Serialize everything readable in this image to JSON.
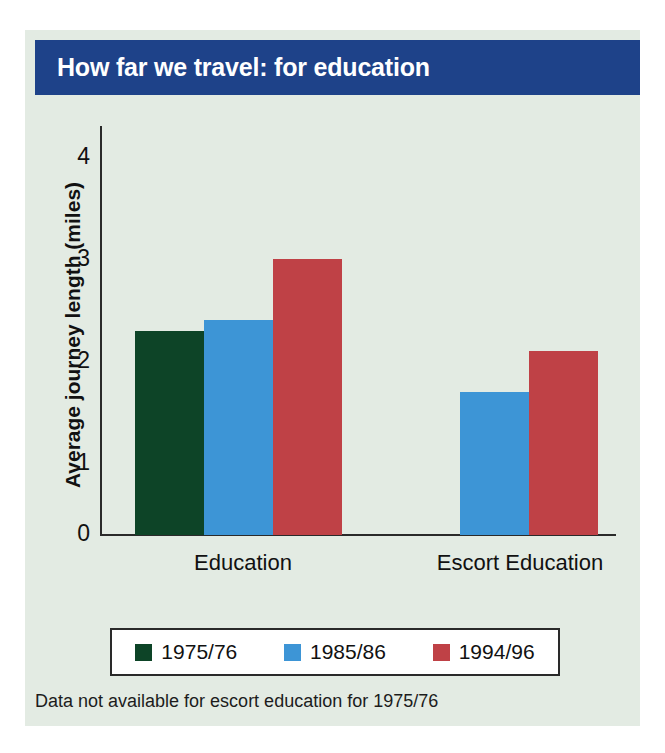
{
  "title": "How far we travel: for education",
  "footnote": "Data not available for escort education for 1975/76",
  "colors": {
    "banner": "#1e4289",
    "background": "#e3ebe3",
    "axis": "#2a2a2a",
    "series_1975_76": "#0d4427",
    "series_1985_86": "#3d95d6",
    "series_1994_96": "#bf4146"
  },
  "legend": {
    "entries": [
      {
        "label": "1975/76",
        "color": "#0d4427"
      },
      {
        "label": "1985/86",
        "color": "#3d95d6"
      },
      {
        "label": "1994/96",
        "color": "#bf4146"
      }
    ]
  },
  "chart_data": {
    "type": "bar",
    "title": "How far we travel: for education",
    "xlabel": "",
    "ylabel": "Average journey length (miles)",
    "ylim": [
      0,
      4
    ],
    "yticks": [
      "0",
      "1",
      "2",
      "3",
      "4"
    ],
    "grid": false,
    "legend_position": "bottom",
    "categories": [
      "Education",
      "Escort Education"
    ],
    "series": [
      {
        "name": "1975/76",
        "color": "#0d4427",
        "values": [
          2.0,
          null
        ]
      },
      {
        "name": "1985/86",
        "color": "#3d95d6",
        "values": [
          2.1,
          1.4
        ]
      },
      {
        "name": "1994/96",
        "color": "#bf4146",
        "values": [
          2.7,
          1.8
        ]
      }
    ],
    "annotation": "Data not available for escort education for 1975/76"
  }
}
